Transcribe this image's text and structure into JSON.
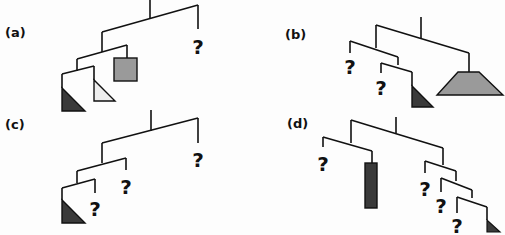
{
  "panels": [
    {
      "id": "a",
      "label": "(a)",
      "unknown": "?"
    },
    {
      "id": "b",
      "label": "(b)",
      "unknown": "?"
    },
    {
      "id": "c",
      "label": "(c)",
      "unknown": "?"
    },
    {
      "id": "d",
      "label": "(d)",
      "unknown": "?"
    }
  ],
  "colors": {
    "dark_shape": "#3a3a3a",
    "mid_gray_shape": "#9a9a9a",
    "light_shape": "#eeeeee",
    "line": "#111111"
  }
}
